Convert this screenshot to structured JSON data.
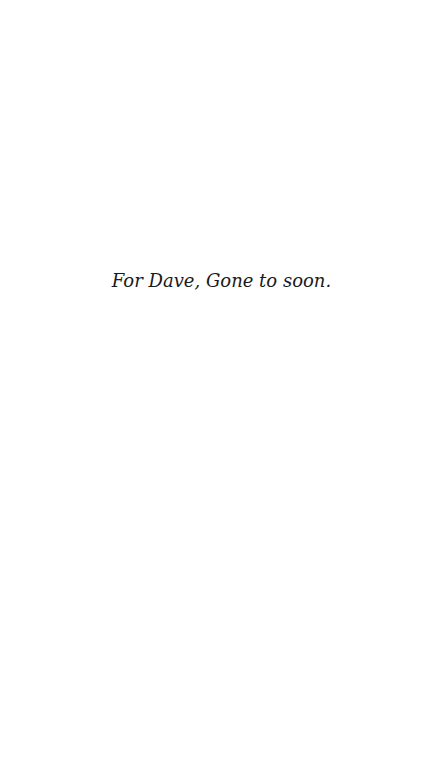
{
  "page": {
    "background": "#ffffff",
    "text_color": "#1a1a1a"
  },
  "dedication": {
    "text": "For Dave, Gone to soon."
  }
}
